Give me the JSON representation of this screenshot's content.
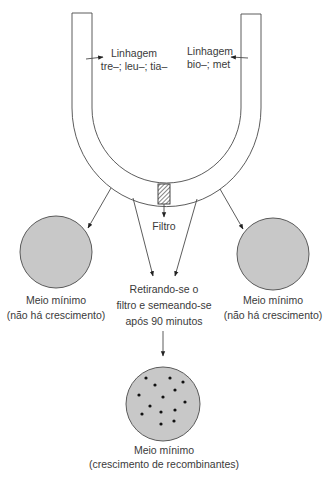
{
  "diagram": {
    "u_tube": {
      "left_strain": {
        "title": "Linhagem",
        "genotype": "tre–; leu–; tia–"
      },
      "right_strain": {
        "title": "Linhagem",
        "genotype": "bio–; met"
      },
      "filter_label": "Filtro"
    },
    "left_plate": {
      "line1": "Meio mínimo",
      "line2": "(não há crescimento)"
    },
    "right_plate": {
      "line1": "Meio mínimo",
      "line2": "(não há crescimento)"
    },
    "process_step": {
      "line1": "Retirando-se o",
      "line2": "filtro e semeando-se",
      "line3": "após 90 minutos"
    },
    "bottom_plate": {
      "line1": "Meio mínimo",
      "line2": "(crescimento de recombinantes)",
      "colony_count": 14
    },
    "colors": {
      "plate_fill": "#c8c8c8",
      "line": "#4a4a4a",
      "text": "#3a3a3a",
      "colony": "#111111"
    }
  }
}
